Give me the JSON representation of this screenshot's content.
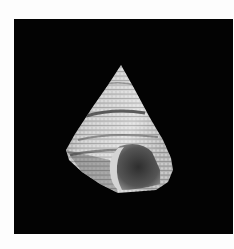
{
  "image": {
    "subject": "Top shell (conical gastropod shell) on black background",
    "alt_text": "Conical top shell with beaded spiral ridges photographed on black",
    "colors": {
      "page_background": "#fdfdfd",
      "photo_background": "#030303",
      "shell_light": "#d8d8d8",
      "shell_mid": "#a8a8a8",
      "shell_dark_band": "#4a4a4a",
      "aperture_inner": "#3a3a3a",
      "aperture_lip": "#cfcfcf"
    }
  }
}
